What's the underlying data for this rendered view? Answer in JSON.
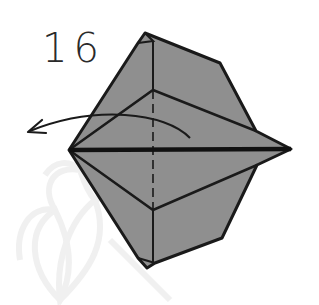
{
  "diagram": {
    "type": "origami-step",
    "step_number": "16",
    "colors": {
      "paper_fill": "#8f8f8f",
      "line": "#1a1a1a",
      "background": "#ffffff",
      "watermark": "#f1f1f1"
    },
    "elements": {
      "model": "folded-paper-model",
      "center_crease": "valley-fold-dashed-line",
      "horizontal_edge": "thick-center-edge",
      "arrow": "curved-fold-arrow-left",
      "watermark": "lotus-watermark"
    }
  }
}
